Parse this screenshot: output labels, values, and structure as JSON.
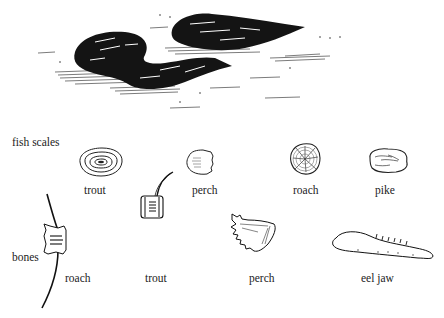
{
  "illustration": {
    "subject": "otter spraint (droppings) containing fish remains",
    "section_labels": {
      "scales": "fish scales",
      "bones": "bones"
    },
    "scales": [
      {
        "label": "trout",
        "icon": "trout-scale-icon"
      },
      {
        "label": "perch",
        "icon": "perch-scale-icon"
      },
      {
        "label": "roach",
        "icon": "roach-scale-icon"
      },
      {
        "label": "pike",
        "icon": "pike-scale-icon"
      }
    ],
    "bones": [
      {
        "label": "roach",
        "icon": "roach-vertebra-icon"
      },
      {
        "label": "trout",
        "icon": "trout-vertebra-icon"
      },
      {
        "label": "perch",
        "icon": "perch-bone-icon"
      },
      {
        "label": "eel jaw",
        "icon": "eel-jaw-icon"
      }
    ],
    "colors": {
      "ink": "#111111",
      "paper": "#ffffff"
    }
  }
}
